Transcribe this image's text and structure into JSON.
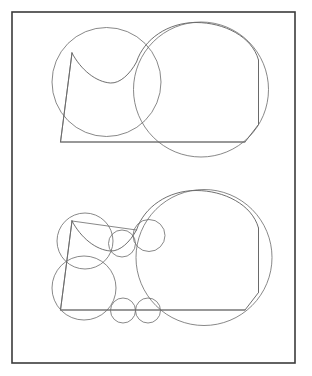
{
  "page": {
    "background_color": "#ffffff",
    "width": 312,
    "height": 376
  },
  "frame": {
    "name": "outer-border",
    "x": 12,
    "y": 12,
    "width": 283,
    "height": 351,
    "stroke_color": "#3b3b3b",
    "stroke_width": 1.6,
    "fill": "none"
  },
  "style": {
    "outline_color": "#555555",
    "outline_width": 0.85,
    "circle_color": "#6a6a6a",
    "circle_width": 0.8,
    "chord_color": "#6a6a6a"
  },
  "chart_data": {
    "type": "scatter",
    "subtitle": "",
    "xlabel": "",
    "ylabel": "",
    "xlim": [
      12,
      295
    ],
    "ylim": [
      12,
      363
    ],
    "grid": false,
    "legend": "none",
    "annotations": [],
    "panels": [
      {
        "name": "top-panel",
        "label": "Coarse packing — 2 inscribed circles",
        "circle_count": 2,
        "region_outline": {
          "description": "Closed region: near-vertical left edge, concave top-left arc, large convex top-right arc, vertical right edge, horizontal bottom edge",
          "path": "M 72 53 L 60.5 142 L 245 142 L 258.5 124.5 L 258.5 60 C 252 36.5 224 22.5 196 22.5 C 168 22.5 144 39 136.5 62 C 130 74 120 83.5 110.5 83 C 96 82 81 70 72 53 Z"
        },
        "circles": [
          {
            "name": "left-inscribed-circle",
            "cx": 106.5,
            "cy": 82.0,
            "r": 54.5
          },
          {
            "name": "right-inscribed-circle",
            "cx": 201.0,
            "cy": 89.5,
            "r": 67.5
          }
        ],
        "chords": [
          {
            "name": "left-circle-chord",
            "x1": 72,
            "y1": 53,
            "x2": 60.5,
            "y2": 142
          },
          {
            "name": "bottom-chord",
            "x1": 60.5,
            "y1": 142,
            "x2": 245,
            "y2": 142
          },
          {
            "name": "right-circle-chord",
            "x1": 258.5,
            "y1": 60,
            "x2": 258.5,
            "y2": 124.5
          }
        ]
      },
      {
        "name": "bottom-panel",
        "label": "Refined packing — 7 inscribed circles",
        "circle_count": 7,
        "region_outline": {
          "description": "Same closed region translated down: near-vertical left edge, concave top-left arc, large convex top-right arc, vertical right edge, horizontal bottom edge",
          "path": "M 72 221 L 60.5 310 L 245 310 L 258.5 292.5 L 258.5 228 C 252 204.5 224 190.5 196 190.5 C 168 190.5 144 207 136.5 230 C 130 242 120 251.5 110.5 251 C 96 250 81 238 72 221 Z"
        },
        "circles": [
          {
            "name": "upper-left-inscribed-circle",
            "cx": 85.0,
            "cy": 241.0,
            "r": 28.0
          },
          {
            "name": "lower-left-inscribed-circle",
            "cx": 84.0,
            "cy": 288.0,
            "r": 32.0
          },
          {
            "name": "mid-small-circle-left",
            "cx": 122.0,
            "cy": 243.5,
            "r": 13.5
          },
          {
            "name": "mid-small-circle-right",
            "cx": 149.0,
            "cy": 235.5,
            "r": 16.0
          },
          {
            "name": "bottom-small-circle-left",
            "cx": 123.0,
            "cy": 310.5,
            "r": 12.5
          },
          {
            "name": "bottom-small-circle-right",
            "cx": 148.0,
            "cy": 310.5,
            "r": 12.5
          },
          {
            "name": "large-right-inscribed-circle",
            "cx": 204.0,
            "cy": 257.5,
            "r": 68.0
          }
        ],
        "chords": [
          {
            "name": "left-edge-chord",
            "x1": 72,
            "y1": 221,
            "x2": 60.5,
            "y2": 310
          },
          {
            "name": "bottom-chord",
            "x1": 60.5,
            "y1": 310,
            "x2": 245,
            "y2": 310
          },
          {
            "name": "right-edge-chord",
            "x1": 258.5,
            "y1": 228,
            "x2": 258.5,
            "y2": 292.5
          },
          {
            "name": "upper-left-diagonal-chord",
            "x1": 72,
            "y1": 221,
            "x2": 136.5,
            "y2": 230
          }
        ]
      }
    ]
  }
}
